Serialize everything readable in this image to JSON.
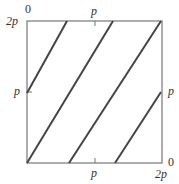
{
  "diagram": {
    "type": "torus-flow-square",
    "labels": {
      "top_left_zero": "0",
      "left_top": "2p",
      "top_mid": "p",
      "left_mid": "p",
      "right_mid": "p",
      "bottom_mid": "p",
      "right_bottom_zero": "0",
      "bottom_right": "2p"
    },
    "colors": {
      "frame": "#777777",
      "lines": "#444444",
      "text": "#333333"
    },
    "square": {
      "x": 27,
      "y": 21,
      "w": 135,
      "h": 142
    },
    "segments": [
      {
        "x1": 27,
        "y1": 93,
        "x2": 67,
        "y2": 21
      },
      {
        "x1": 27,
        "y1": 163,
        "x2": 113,
        "y2": 21
      },
      {
        "x1": 69,
        "y1": 163,
        "x2": 161,
        "y2": 21
      },
      {
        "x1": 115,
        "y1": 163,
        "x2": 161,
        "y2": 92
      }
    ]
  }
}
